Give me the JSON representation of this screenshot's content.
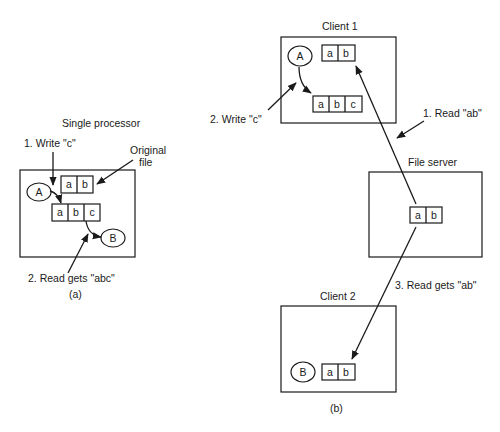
{
  "panel_a": {
    "title": "Single processor",
    "caption": "(a)",
    "step1": "1. Write \"c\"",
    "original_file_line1": "Original",
    "original_file_line2": "file",
    "step2": "2. Read gets \"abc\"",
    "process_a": "A",
    "process_b": "B",
    "file_original": [
      "a",
      "b"
    ],
    "file_new": [
      "a",
      "b",
      "c"
    ]
  },
  "panel_b": {
    "caption": "(b)",
    "client1": {
      "title": "Client 1",
      "process": "A",
      "file_original": [
        "a",
        "b"
      ],
      "file_new": [
        "a",
        "b",
        "c"
      ]
    },
    "file_server": {
      "title": "File server",
      "file": [
        "a",
        "b"
      ]
    },
    "client2": {
      "title": "Client 2",
      "process": "B",
      "file": [
        "a",
        "b"
      ]
    },
    "step1": "1. Read \"ab\"",
    "step2": "2. Write \"c\"",
    "step3": "3. Read gets \"ab\""
  }
}
